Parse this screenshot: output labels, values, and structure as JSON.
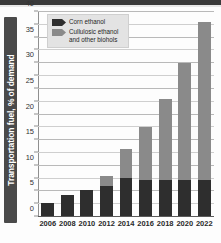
{
  "chart_data": {
    "type": "bar",
    "title": "",
    "subtitle": "",
    "xlabel": "",
    "ylabel": "Transportation fuel, % of demand",
    "ylim": [
      0,
      40
    ],
    "ytick_step_major": 5,
    "ytick_step_minor": 2.5,
    "grid": true,
    "stacked": true,
    "legend_position": "top-left-inside",
    "categories": [
      "2006",
      "2008",
      "2010",
      "2012",
      "2014",
      "2016",
      "2018",
      "2020",
      "2022"
    ],
    "yticks": [
      "0",
      "5",
      "10",
      "15",
      "20",
      "25",
      "30",
      "35",
      "40"
    ],
    "series": [
      {
        "name": "Corn ethanol",
        "color": "#2e2e2e",
        "values": [
          2.8,
          4.2,
          5.2,
          6.0,
          7.7,
          7.2,
          7.2,
          7.2,
          7.2
        ]
      },
      {
        "name": "Cullulosic ethanol and other biohols",
        "color": "#8a8a8a",
        "values": [
          0,
          0,
          0,
          2.0,
          5.5,
          10.3,
          15.8,
          22.9,
          30.9
        ]
      }
    ],
    "totals": [
      2.8,
      4.2,
      5.2,
      8.0,
      13.2,
      17.5,
      23.0,
      30.1,
      38.1
    ]
  },
  "legend": {
    "items": [
      {
        "label": "Corn ethanol",
        "swatch": "dark-arrow-swatch"
      },
      {
        "label_line1": "Cullulosic ethanol",
        "label_line2": "and other biohols",
        "swatch": "gray-arrow-swatch"
      }
    ]
  }
}
